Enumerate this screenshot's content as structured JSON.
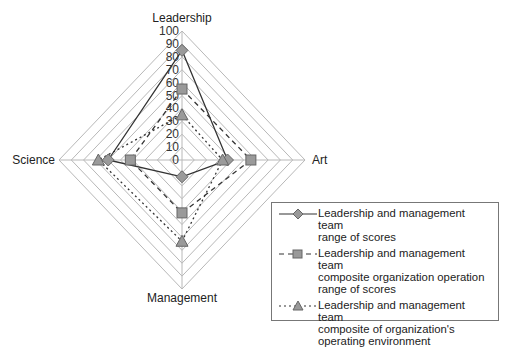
{
  "chart_data": {
    "type": "radar",
    "title": "",
    "axes": [
      "Leadership",
      "Art",
      "Management",
      "Science"
    ],
    "radial_ticks": [
      "0",
      "10",
      "20",
      "30",
      "40",
      "50",
      "60",
      "70",
      "80",
      "90",
      "100"
    ],
    "range": [
      0,
      100
    ],
    "grid": true,
    "legend_position": "bottom-right",
    "series": [
      {
        "name": "Leadership and management team range of scores",
        "marker": "diamond",
        "line": "solid",
        "values": [
          85,
          37,
          13,
          60
        ]
      },
      {
        "name": "Leadership and management team composite organization operation range of scores",
        "marker": "square",
        "line": "dashed",
        "values": [
          55,
          56,
          41,
          42
        ]
      },
      {
        "name": "Leadership and management team composite of organization's operating environment",
        "marker": "triangle",
        "line": "dotted",
        "values": [
          35,
          33,
          63,
          68
        ]
      }
    ]
  },
  "legend": {
    "items": [
      {
        "lines": [
          "Leadership and management team",
          "range of scores"
        ]
      },
      {
        "lines": [
          "Leadership and management team",
          "composite organization operation",
          "range of scores"
        ]
      },
      {
        "lines": [
          "Leadership and management team",
          "composite of organization's",
          "operating environment"
        ]
      }
    ]
  }
}
